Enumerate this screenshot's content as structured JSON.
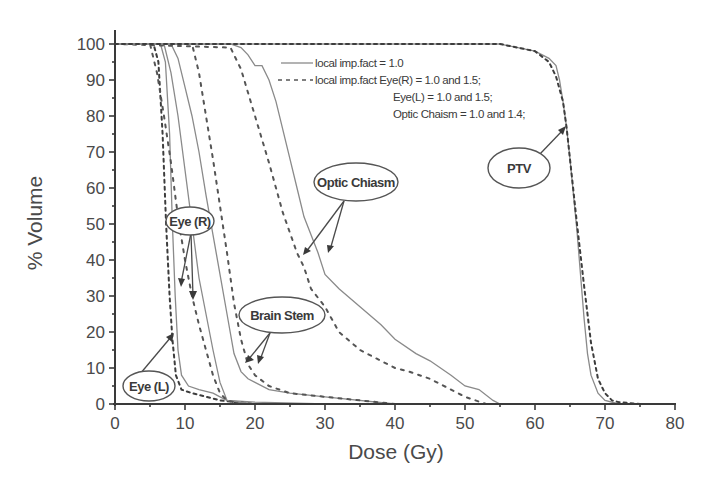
{
  "chart_data": {
    "type": "line",
    "title": "",
    "xlabel": "Dose (Gy)",
    "ylabel": "% Volume",
    "xlim": [
      0,
      80
    ],
    "ylim": [
      0,
      100
    ],
    "x_ticks": [
      0,
      10,
      20,
      30,
      40,
      50,
      60,
      70,
      80
    ],
    "y_ticks": [
      0,
      10,
      20,
      30,
      40,
      50,
      60,
      70,
      80,
      90,
      100
    ],
    "grid": false,
    "legend": {
      "position": "upper-right-inside",
      "entries": [
        {
          "style": "solid",
          "label": "local imp.fact = 1.0"
        },
        {
          "style": "dashed",
          "label": "local imp.fact Eye(R) = 1.0 and 1.5;"
        }
      ],
      "continuation_lines": [
        "Eye(L) = 1.0 and 1.5;",
        "Optic Chaism = 1.0 and 1.4;"
      ]
    },
    "annotations": [
      "Eye (R)",
      "Eye (L)",
      "Brain Stem",
      "Optic Chiasm",
      "PTV"
    ],
    "series": [
      {
        "name": "Eye(L) - local imp.fact = 1.0",
        "style": "solid",
        "x": [
          0,
          6.5,
          7.2,
          7.8,
          8.2,
          8.6,
          9.0,
          9.5,
          10.5,
          12,
          14,
          15,
          16,
          20,
          30
        ],
        "y": [
          100,
          100,
          95,
          75,
          50,
          30,
          15,
          8,
          5,
          4,
          3,
          2,
          1,
          0.5,
          0
        ]
      },
      {
        "name": "Eye(L) - imp.fact 1.0 and 1.5",
        "style": "dashed",
        "x": [
          0,
          5.5,
          6.2,
          6.8,
          7.3,
          7.8,
          8.2,
          8.7,
          9.5,
          11,
          13,
          15,
          20
        ],
        "y": [
          100,
          100,
          95,
          75,
          50,
          30,
          18,
          8,
          4,
          3,
          2,
          1,
          0
        ]
      },
      {
        "name": "Eye(R) - local imp.fact = 1.0",
        "style": "solid",
        "x": [
          0,
          7,
          8,
          9,
          10,
          11,
          12,
          13,
          14,
          15,
          16,
          20
        ],
        "y": [
          100,
          100,
          92,
          80,
          65,
          50,
          35,
          25,
          15,
          6,
          1,
          0
        ]
      },
      {
        "name": "Eye(R) - imp.fact 1.0 and 1.5",
        "style": "dashed",
        "x": [
          0,
          5,
          6,
          7,
          8,
          9,
          10,
          11,
          12,
          13,
          14,
          15,
          16,
          18
        ],
        "y": [
          100,
          100,
          92,
          80,
          67,
          52,
          40,
          30,
          22,
          15,
          8,
          3,
          1,
          0
        ]
      },
      {
        "name": "Brain Stem - local imp.fact = 1.0",
        "style": "solid",
        "x": [
          0,
          8,
          9,
          10,
          11,
          12,
          13,
          14,
          15,
          16,
          17,
          18,
          19,
          20,
          22,
          25,
          30,
          40
        ],
        "y": [
          100,
          100,
          96,
          88,
          80,
          70,
          58,
          47,
          36,
          25,
          14,
          9,
          7,
          6,
          4,
          3,
          2,
          0
        ]
      },
      {
        "name": "Brain Stem - imp.fact adjusted",
        "style": "dashed",
        "x": [
          0,
          11,
          12,
          13,
          14,
          15,
          16,
          17,
          18,
          19,
          20,
          22,
          25,
          30,
          40
        ],
        "y": [
          100,
          100,
          92,
          80,
          68,
          55,
          42,
          28,
          18,
          11,
          8,
          5,
          3,
          2,
          0
        ]
      },
      {
        "name": "Optic Chiasm - local imp.fact = 1.0",
        "style": "solid",
        "x": [
          0,
          16.5,
          18,
          19,
          20,
          21,
          22,
          23,
          24,
          25,
          26,
          27,
          28,
          29,
          30,
          32,
          35,
          38,
          40,
          43,
          45,
          48,
          50,
          52,
          54,
          55
        ],
        "y": [
          100,
          100,
          99,
          97,
          94,
          94,
          90,
          84,
          76,
          68,
          60,
          52,
          47,
          42,
          36,
          32,
          27,
          22,
          18,
          14,
          12,
          8,
          5,
          4,
          1,
          0
        ]
      },
      {
        "name": "Optic Chiasm - imp.fact 1.0 and 1.4",
        "style": "dashed",
        "x": [
          0,
          16.5,
          18,
          20,
          22,
          24,
          26,
          27,
          28,
          30,
          32,
          35,
          38,
          40,
          42,
          45,
          48,
          50,
          53
        ],
        "y": [
          100,
          99,
          93,
          80,
          67,
          53,
          42,
          38,
          32,
          27,
          20,
          15,
          12,
          10,
          9,
          7,
          4,
          2,
          0
        ]
      },
      {
        "name": "PTV - local imp.fact = 1.0",
        "style": "solid",
        "x": [
          0,
          55,
          60,
          62,
          63,
          63.5,
          64,
          64.5,
          65,
          65.5,
          66,
          66.5,
          67,
          67.5,
          68,
          69,
          70,
          72
        ],
        "y": [
          100,
          100,
          98,
          96,
          94,
          90,
          84,
          77,
          68,
          58,
          48,
          36,
          24,
          14,
          8,
          3,
          1,
          0
        ]
      },
      {
        "name": "PTV - imp.fact adjusted",
        "style": "dashed",
        "x": [
          0,
          55,
          60,
          62,
          63,
          64,
          64.5,
          65,
          66,
          67,
          68,
          69,
          70,
          71,
          72,
          75
        ],
        "y": [
          100,
          100,
          98,
          95,
          91,
          84,
          77,
          68,
          50,
          33,
          17,
          7,
          3,
          1,
          0.5,
          0
        ]
      }
    ]
  },
  "labels": {
    "xlabel": "Dose (Gy)",
    "ylabel": "% Volume",
    "legend_solid": "local imp.fact = 1.0",
    "legend_dashed": "local imp.fact Eye(R) = 1.0 and 1.5;",
    "legend_line3": "Eye(L) = 1.0 and 1.5;",
    "legend_line4": "Optic Chaism = 1.0 and 1.4;",
    "annot_eye_r": "Eye (R)",
    "annot_eye_l": "Eye (L)",
    "annot_brain_stem": "Brain Stem",
    "annot_optic_chiasm": "Optic Chiasm",
    "annot_ptv": "PTV",
    "x_tick_labels": [
      "0",
      "10",
      "20",
      "30",
      "40",
      "50",
      "60",
      "70",
      "80"
    ],
    "y_tick_labels": [
      "0",
      "10",
      "20",
      "30",
      "40",
      "50",
      "60",
      "70",
      "80",
      "90",
      "100"
    ]
  }
}
